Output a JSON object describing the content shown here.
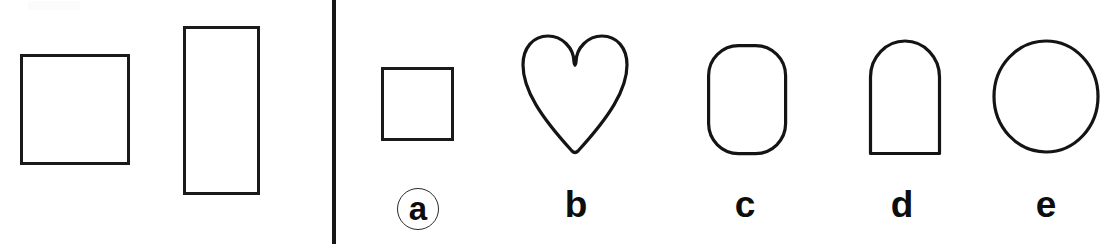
{
  "figure": {
    "type": "shape-identification-figure",
    "background_color": "#ffffff",
    "stroke_color": "#141414",
    "divider_color": "#161616"
  },
  "prompt_panel": {
    "name": "prompt-panel",
    "shapes": [
      {
        "id": "example-square",
        "semantic_name": "square",
        "kind": "square",
        "x": 20,
        "y": 54,
        "width": 110,
        "height": 111,
        "stroke_width": 3
      },
      {
        "id": "example-rectangle",
        "semantic_name": "rectangle",
        "kind": "rectangle",
        "x": 183,
        "y": 26,
        "width": 77,
        "height": 169,
        "stroke_width": 3
      }
    ]
  },
  "divider": {
    "name": "vertical-divider",
    "x": 332,
    "y": 0,
    "width": 4,
    "height": 244
  },
  "options_panel": {
    "name": "options-panel",
    "options": [
      {
        "label": "a",
        "circled": true,
        "shape_kind": "square",
        "shape_name": "small-square",
        "x": 381,
        "y": 67,
        "width": 73,
        "height": 74,
        "label_x": 418,
        "label_y": 209
      },
      {
        "label": "b",
        "circled": false,
        "shape_kind": "heart",
        "shape_name": "heart",
        "x": 526,
        "y": 38,
        "width": 97,
        "height": 114,
        "label_x": 576,
        "label_y": 206
      },
      {
        "label": "c",
        "circled": false,
        "shape_kind": "rounded-rectangle",
        "shape_name": "rounded-rectangle",
        "x": 708,
        "y": 44,
        "width": 77,
        "height": 108,
        "corner_radius": 30,
        "label_x": 745,
        "label_y": 206
      },
      {
        "label": "d",
        "circled": false,
        "shape_kind": "arch",
        "shape_name": "arch",
        "x": 869,
        "y": 42,
        "width": 69,
        "height": 110,
        "top_radius": 35,
        "label_x": 902,
        "label_y": 206
      },
      {
        "label": "e",
        "circled": false,
        "shape_kind": "circle",
        "shape_name": "circle",
        "x": 994,
        "y": 41,
        "width": 104,
        "height": 111,
        "label_x": 1046,
        "label_y": 206
      }
    ]
  }
}
